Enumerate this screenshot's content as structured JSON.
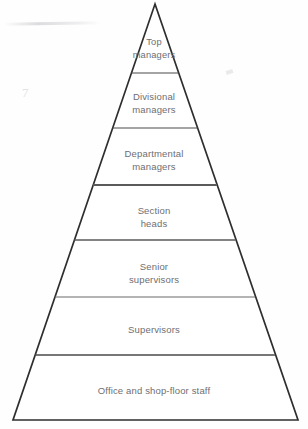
{
  "diagram": {
    "type": "pyramid",
    "orientation": "apex-up",
    "tier_count": 7,
    "colors": {
      "outline": "#2e2e2e",
      "divider": "#4a4a4a",
      "text": "#6e6e72",
      "background": "#fefefe"
    },
    "geometry": {
      "apex_x": 155,
      "apex_y": 4,
      "base_left_x": 13,
      "base_right_x": 298,
      "base_y": 420,
      "divider_y": [
        73,
        128,
        185,
        240,
        297,
        355
      ]
    },
    "tiers": [
      {
        "rank": 1,
        "label": "Top\nmanagers",
        "label_text": "Top managers"
      },
      {
        "rank": 2,
        "label": "Divisional\nmanagers",
        "label_text": "Divisional managers"
      },
      {
        "rank": 3,
        "label": "Departmental\nmanagers",
        "label_text": "Departmental managers"
      },
      {
        "rank": 4,
        "label": "Section\nheads",
        "label_text": "Section heads"
      },
      {
        "rank": 5,
        "label": "Senior\nsupervisors",
        "label_text": "Senior supervisors"
      },
      {
        "rank": 6,
        "label": "Supervisors",
        "label_text": "Supervisors"
      },
      {
        "rank": 7,
        "label": "Office and shop-floor staff",
        "label_text": "Office and shop-floor staff"
      }
    ]
  }
}
